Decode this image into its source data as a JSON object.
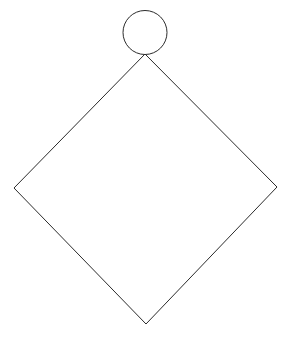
{
  "canvas": {
    "width": 288,
    "height": 341,
    "background_color": "#ffffff",
    "title": "Line drawing of a diamond with a circle at its top vertex"
  },
  "style": {
    "stroke_color": "#2b2b2b",
    "stroke_width": 1,
    "fill": "none"
  },
  "shapes": [
    {
      "name": "circle",
      "type": "circle",
      "center_x": 145,
      "center_y": 32.5,
      "radius": 22,
      "stroke_color": "#2b2b2b",
      "stroke_width": 1,
      "fill": "none"
    },
    {
      "name": "diamond",
      "type": "polygon",
      "points": "145,54 277,187 146,324 14,188",
      "vertices": [
        {
          "label": "top",
          "x": 145,
          "y": 54
        },
        {
          "label": "right",
          "x": 277,
          "y": 187
        },
        {
          "label": "bottom",
          "x": 146,
          "y": 324
        },
        {
          "label": "left",
          "x": 14,
          "y": 188
        }
      ],
      "stroke_color": "#2b2b2b",
      "stroke_width": 1,
      "fill": "none"
    }
  ]
}
